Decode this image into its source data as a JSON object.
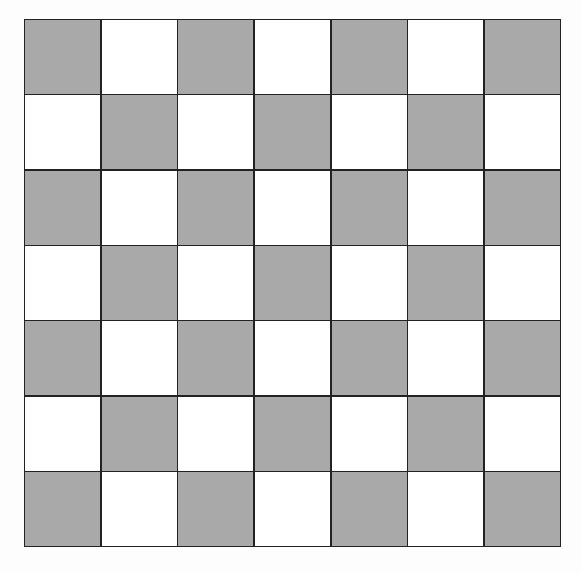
{
  "board": {
    "rows": 7,
    "cols": 7,
    "colors": {
      "dark": "#a9a9a9",
      "light": "#ffffff",
      "line": "#222222"
    },
    "pattern": [
      [
        1,
        0,
        1,
        0,
        1,
        0,
        1
      ],
      [
        0,
        1,
        0,
        1,
        0,
        1,
        0
      ],
      [
        1,
        0,
        1,
        0,
        1,
        0,
        1
      ],
      [
        0,
        1,
        0,
        1,
        0,
        1,
        0
      ],
      [
        1,
        0,
        1,
        0,
        1,
        0,
        1
      ],
      [
        0,
        1,
        0,
        1,
        0,
        1,
        0
      ],
      [
        1,
        0,
        1,
        0,
        1,
        0,
        1
      ]
    ]
  }
}
